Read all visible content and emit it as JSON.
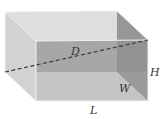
{
  "diagram": {
    "labels": {
      "diagonal": "D",
      "height": "H",
      "width": "W",
      "length": "L"
    },
    "colors": {
      "top_face": "#dedede",
      "left_face": "#cfcfcf",
      "back_face": "#a9a9a9",
      "bottom_face": "#c6c6c6",
      "right_face": "#8e8e8e",
      "edges": "#f4f4f4",
      "diagonal": "#3a3a3a",
      "label": "#333333"
    },
    "vertices": {
      "back_top_left": [
        5,
        12
      ],
      "back_top_right": [
        117,
        11
      ],
      "back_bottom_left": [
        5,
        72
      ],
      "back_bottom_right": [
        117,
        72
      ],
      "front_top_left": [
        36,
        41
      ],
      "front_top_right": [
        148,
        40
      ],
      "front_bottom_left": [
        36,
        101
      ],
      "front_bottom_right": [
        148,
        101
      ]
    }
  }
}
